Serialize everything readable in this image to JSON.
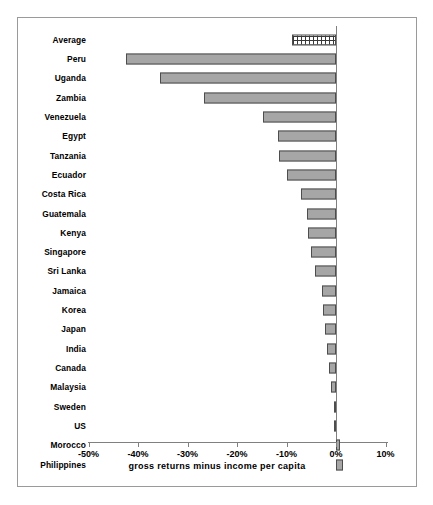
{
  "chart_data": {
    "type": "bar",
    "orientation": "horizontal",
    "title": "",
    "xlabel": "gross returns minus income per capita",
    "ylabel": "",
    "xlim": [
      -50,
      10
    ],
    "xticks": [
      -50,
      -40,
      -30,
      -20,
      -10,
      0,
      10
    ],
    "xtick_labels": [
      "-50%",
      "-40%",
      "-30%",
      "-20%",
      "-10%",
      "0%",
      "10%"
    ],
    "grid": false,
    "legend": null,
    "categories": [
      "Average",
      "Peru",
      "Uganda",
      "Zambia",
      "Venezuela",
      "Egypt",
      "Tanzania",
      "Ecuador",
      "Costa Rica",
      "Guatemala",
      "Kenya",
      "Singapore",
      "Sri Lanka",
      "Jamaica",
      "Korea",
      "Japan",
      "India",
      "Canada",
      "Malaysia",
      "Sweden",
      "US",
      "Morocco",
      "Philippines"
    ],
    "values": [
      -8.9,
      -42.4,
      -35.6,
      -26.7,
      -14.7,
      -11.7,
      -11.5,
      -9.9,
      -7.1,
      -5.9,
      -5.7,
      -5.1,
      -4.3,
      -2.8,
      -2.6,
      -2.2,
      -1.8,
      -1.4,
      -1.0,
      -0.4,
      -0.1,
      0.9,
      1.4
    ],
    "bar_styles": [
      "hatched",
      "solid",
      "solid",
      "solid",
      "solid",
      "solid",
      "solid",
      "solid",
      "solid",
      "solid",
      "solid",
      "solid",
      "solid",
      "solid",
      "solid",
      "solid",
      "solid",
      "solid",
      "solid",
      "solid",
      "solid",
      "solid",
      "solid"
    ],
    "colors": {
      "bar_fill": "#a6a6a6",
      "bar_border": "#4d4d4d",
      "average_fill": "#ffffff",
      "average_pattern": "#3a3a3a",
      "axis": "#808080",
      "frame": "#9a9a9a",
      "text": "#000000",
      "background": "#ffffff"
    }
  }
}
